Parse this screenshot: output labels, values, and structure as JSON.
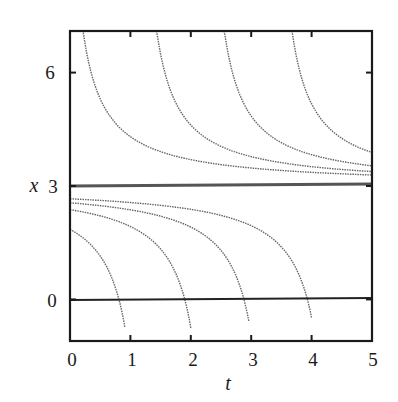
{
  "chart_data": {
    "type": "line",
    "title": "",
    "xlabel": "t",
    "ylabel": "x",
    "xlim": [
      0,
      5
    ],
    "ylim": [
      -1.1,
      7.1
    ],
    "xticks": [
      0,
      1,
      2,
      3,
      4,
      5
    ],
    "yticks": [
      0,
      3,
      6
    ],
    "grid": false,
    "legend": null,
    "reference_lines": [
      {
        "name": "equilibrium x=3",
        "y": 3,
        "style": "solid-thick"
      },
      {
        "name": "x=0 axis",
        "y": 0,
        "style": "solid"
      }
    ],
    "series": [
      {
        "name": "upper-1",
        "style": "dotted",
        "model": "x = 3 + 1.5/(t - c)",
        "c": -0.15,
        "t_range": [
          0.22,
          5
        ]
      },
      {
        "name": "upper-2",
        "style": "dotted",
        "model": "x = 3 + 1.5/(t - c)",
        "c": 1.07,
        "t_range": [
          1.43,
          5
        ]
      },
      {
        "name": "upper-3",
        "style": "dotted",
        "model": "x = 3 + 1.5/(t - c)",
        "c": 2.19,
        "t_range": [
          2.55,
          5
        ]
      },
      {
        "name": "upper-4",
        "style": "dotted",
        "model": "x = 3 + 1.5/(t - c)",
        "c": 3.31,
        "t_range": [
          3.67,
          5
        ]
      },
      {
        "name": "lower-1",
        "style": "dotted",
        "model": "x = 3 + 1.5/(t - c)",
        "c": 1.31,
        "t_range": [
          0,
          0.91
        ]
      },
      {
        "name": "lower-2",
        "style": "dotted",
        "model": "x = 3 + 1.5/(t - c)",
        "c": 2.4,
        "t_range": [
          0,
          2.0
        ]
      },
      {
        "name": "lower-3",
        "style": "dotted",
        "model": "x = 3 + 1.5/(t - c)",
        "c": 3.38,
        "t_range": [
          0,
          2.96
        ]
      },
      {
        "name": "lower-4",
        "style": "dotted",
        "model": "x = 3 + 1.5/(t - c)",
        "c": 4.43,
        "t_range": [
          0,
          4.0
        ]
      }
    ],
    "key_points": {
      "upper_start_t_at_top": [
        0.22,
        1.43,
        2.55,
        3.67
      ],
      "upper_end_x_at_t5": [
        3.3,
        3.4,
        3.6,
        3.8
      ],
      "lower_start_x_at_t0": [
        2.05,
        2.5,
        2.66,
        2.73
      ],
      "lower_zero_crossing_t": [
        0.81,
        1.9,
        2.88,
        3.93
      ]
    }
  },
  "labels": {
    "xlabel": "t",
    "ylabel": "x",
    "xticks": [
      "0",
      "1",
      "2",
      "3",
      "4",
      "5"
    ],
    "yticks": [
      "0",
      "3",
      "6"
    ]
  }
}
